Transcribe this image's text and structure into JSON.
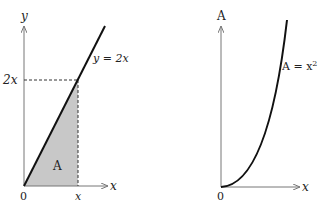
{
  "left": {
    "y_axis_label": "y",
    "x_axis_label": "x",
    "origin_label": "0",
    "y_tick_label": "2x",
    "x_tick_label": "x",
    "line_label": "y = 2x",
    "area_label": "A",
    "fill_color": "#c8c8c8"
  },
  "right": {
    "y_axis_label": "A",
    "x_axis_label": "x",
    "origin_label": "0",
    "curve_label_prefix": "A = x",
    "curve_label_exp": "2"
  }
}
